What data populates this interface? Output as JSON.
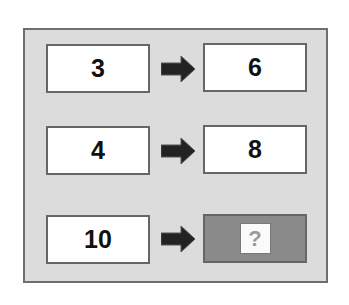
{
  "puzzle": {
    "rows": [
      {
        "input": "3",
        "output": "6"
      },
      {
        "input": "4",
        "output": "8"
      },
      {
        "input": "10",
        "output": "?"
      }
    ],
    "colors": {
      "frame_bg": "#dcdcdc",
      "unknown_bg": "#8a8a8a",
      "arrow": "#222222"
    }
  }
}
